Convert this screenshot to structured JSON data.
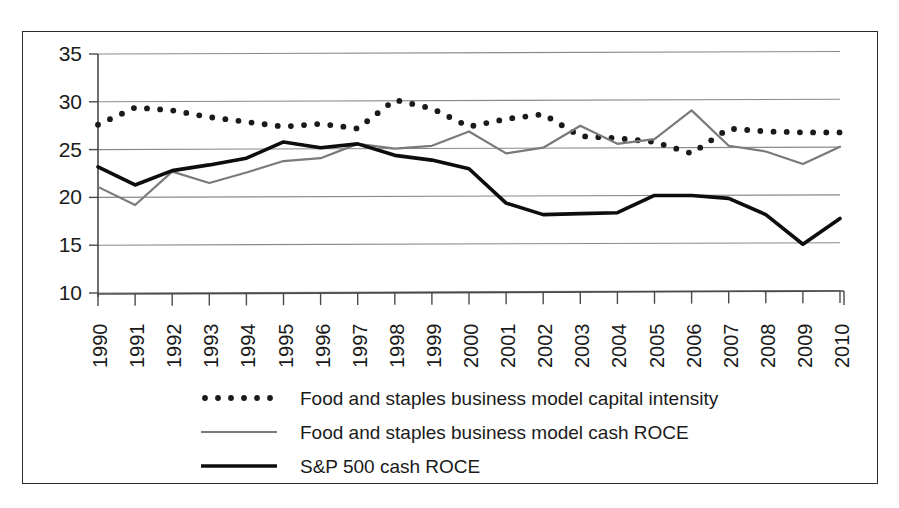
{
  "chart_data": {
    "type": "line",
    "title": "",
    "subtitle": "",
    "xlabel": "",
    "ylabel": "",
    "grid": true,
    "legend_position": "bottom",
    "ylim": [
      10,
      35
    ],
    "ytick_labels": [
      "10",
      "15",
      "20",
      "25",
      "30",
      "35"
    ],
    "yticks": [
      10,
      15,
      20,
      25,
      30,
      35
    ],
    "categories": [
      "1990",
      "1991",
      "1992",
      "1993",
      "1994",
      "1995",
      "1996",
      "1997",
      "1998",
      "1999",
      "2000",
      "2001",
      "2002",
      "2003",
      "2004",
      "2005",
      "2006",
      "2007",
      "2008",
      "2009",
      "2010"
    ],
    "x": [
      1990,
      1991,
      1992,
      1993,
      1994,
      1995,
      1996,
      1997,
      1998,
      1999,
      2000,
      2001,
      2002,
      2003,
      2004,
      2005,
      2006,
      2007,
      2008,
      2009,
      2010
    ],
    "series": [
      {
        "name": "Food and staples business model capital intensity",
        "style": "dotted",
        "color": "#1a1a1a",
        "values": [
          27.6,
          29.4,
          29.1,
          28.4,
          27.9,
          27.4,
          27.7,
          27.2,
          30.2,
          29.3,
          27.4,
          28.2,
          28.7,
          26.4,
          26.2,
          25.8,
          24.6,
          27.2,
          26.9,
          26.8,
          26.8
        ]
      },
      {
        "name": "Food and staples business model cash ROCE",
        "style": "solid-gray",
        "color": "#7a7a7a",
        "values": [
          21.1,
          19.2,
          22.7,
          21.5,
          22.6,
          23.8,
          24.1,
          25.6,
          25.1,
          25.4,
          26.9,
          24.6,
          25.2,
          27.5,
          25.6,
          26.1,
          29.1,
          25.4,
          24.8,
          23.5,
          25.3
        ]
      },
      {
        "name": "S&P 500 cash ROCE",
        "style": "solid-black",
        "color": "#0d0d0d",
        "values": [
          23.2,
          21.3,
          22.8,
          23.4,
          24.1,
          25.8,
          25.2,
          25.6,
          24.4,
          23.9,
          23.0,
          19.4,
          18.2,
          18.3,
          18.4,
          20.2,
          20.2,
          19.9,
          18.2,
          15.1,
          17.8
        ]
      }
    ]
  },
  "legend": {
    "items": [
      {
        "label": "Food and staples business model capital intensity",
        "style": "dotted",
        "color": "#1a1a1a"
      },
      {
        "label": "Food and staples business model cash ROCE",
        "style": "solid-gray",
        "color": "#7a7a7a"
      },
      {
        "label": "S&P 500 cash ROCE",
        "style": "solid-black",
        "color": "#0d0d0d"
      }
    ]
  }
}
